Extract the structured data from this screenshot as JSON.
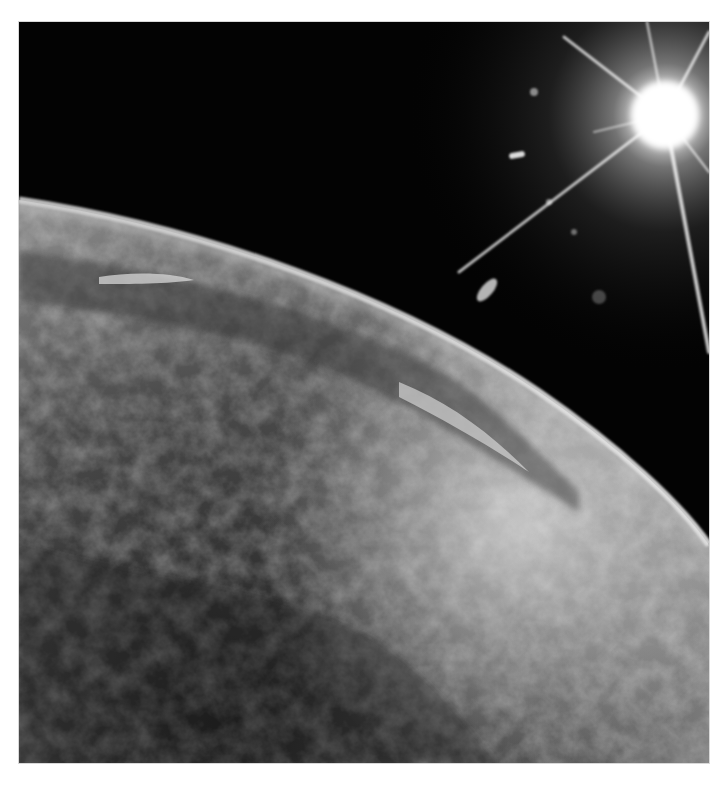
{
  "image": {
    "subject": "Earth's curved horizon seen from orbit with the sun flaring above",
    "alt": "Black and white photograph of Earth from space with cloud-covered surface and bright sun with starburst",
    "style": "grayscale",
    "colors": {
      "border": "#ffffff",
      "space": "#030303",
      "sun_core": "#ffffff",
      "atmosphere_glow": "#e6e6e6",
      "cloud_light": "#c8c8c8",
      "surface_dark": "#2a2a2a"
    },
    "elements": {
      "earth_limb": "curved horizon from upper-left to lower-right",
      "sun": "bright starburst in upper-right corner",
      "lens_flares": "small light spots near sun",
      "cloud_cover": "textured clouds across lower half"
    }
  }
}
